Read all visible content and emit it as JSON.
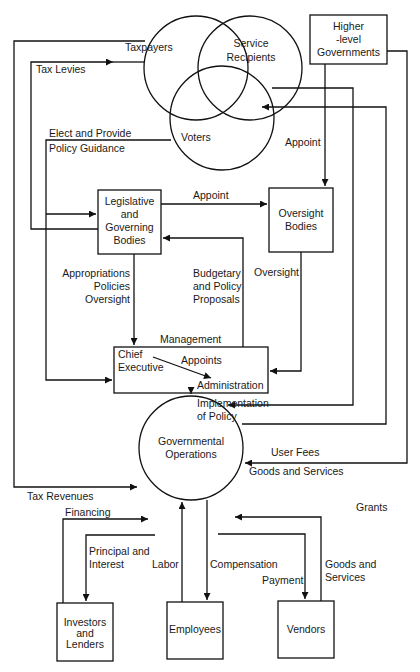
{
  "diagram": {
    "type": "flow",
    "stakeholder_circles": {
      "taxpayers": "Taxpayers",
      "service_recipients_line1": "Service",
      "service_recipients_line2": "Recipients",
      "voters": "Voters"
    },
    "nodes": {
      "higher_gov_line1": "Higher",
      "higher_gov_line2": "-level",
      "higher_gov_line3": "Governments",
      "legislative_line1": "Legislative",
      "legislative_line2": "and",
      "legislative_line3": "Governing",
      "legislative_line4": "Bodies",
      "oversight_line1": "Oversight",
      "oversight_line2": "Bodies",
      "chief_exec_line1": "Chief",
      "chief_exec_line2": "Executive",
      "administration": "Administration",
      "gov_ops_line1": "Governmental",
      "gov_ops_line2": "Operations",
      "investors_line1": "Investors",
      "investors_line2": "and",
      "investors_line3": "Lenders",
      "employees": "Employees",
      "vendors": "Vendors"
    },
    "edge_labels": {
      "tax_levies": "Tax Levies",
      "elect_line1": "Elect and Provide",
      "elect_line2": "Policy Guidance",
      "appoint_higher": "Appoint",
      "appoint_leg": "Appoint",
      "appropriations_line1": "Appropriations",
      "appropriations_line2": "Policies",
      "appropriations_line3": "Oversight",
      "budgetary_line1": "Budgetary",
      "budgetary_line2": "and Policy",
      "budgetary_line3": "Proposals",
      "oversight": "Oversight",
      "management": "Management",
      "appoints": "Appoints",
      "implementation_line1": "Implementation",
      "implementation_line2": "of Policy",
      "user_fees": "User Fees",
      "goods_services_top": "Goods and Services",
      "tax_revenues": "Tax Revenues",
      "grants": "Grants",
      "financing": "Financing",
      "principal_line1": "Principal and",
      "principal_line2": "Interest",
      "labor": "Labor",
      "compensation": "Compensation",
      "payment": "Payment",
      "goods_services_vendor_line1": "Goods and",
      "goods_services_vendor_line2": "Services"
    }
  }
}
